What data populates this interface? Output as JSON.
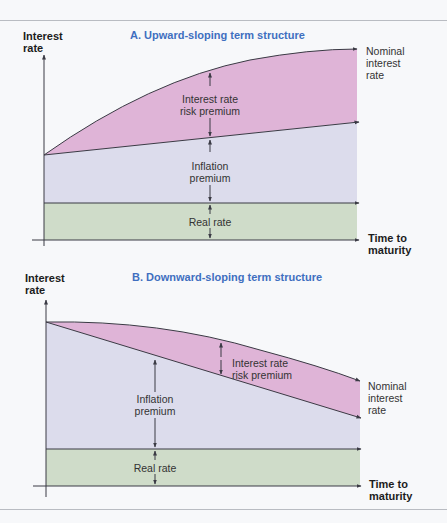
{
  "colors": {
    "risk_premium": "#dfb4d7",
    "inflation_premium": "#dcdcec",
    "real_rate": "#cfdcc9",
    "title": "#3f6fc0",
    "line": "#3a3a44"
  },
  "panel_a": {
    "title": "A. Upward-sloping term structure",
    "y_axis_label_1": "Interest",
    "y_axis_label_2": "rate",
    "x_axis_label_1": "Time to",
    "x_axis_label_2": "maturity",
    "nominal_1": "Nominal",
    "nominal_2": "interest",
    "nominal_3": "rate",
    "risk_1": "Interest rate",
    "risk_2": "risk premium",
    "inflation_1": "Inflation",
    "inflation_2": "premium",
    "real": "Real rate"
  },
  "panel_b": {
    "title": "B. Downward-sloping term structure",
    "y_axis_label_1": "Interest",
    "y_axis_label_2": "rate",
    "x_axis_label_1": "Time to",
    "x_axis_label_2": "maturity",
    "nominal_1": "Nominal",
    "nominal_2": "interest",
    "nominal_3": "rate",
    "risk_1": "Interest rate",
    "risk_2": "risk premium",
    "inflation_1": "Inflation",
    "inflation_2": "premium",
    "real": "Real rate"
  }
}
